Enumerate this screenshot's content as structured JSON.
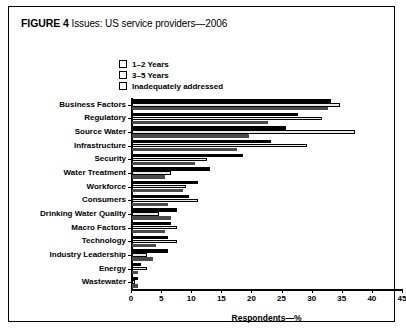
{
  "figure": {
    "label": "FIGURE 4",
    "caption": "Issues: US service providers—2006"
  },
  "legend": {
    "items": [
      {
        "label": "1–2 Years",
        "swatch": "solid-black"
      },
      {
        "label": "3–5 Years",
        "swatch": "light-gray"
      },
      {
        "label": "Inadequately addressed",
        "swatch": "dark-gray"
      }
    ]
  },
  "axis": {
    "x_title": "Respondents—%",
    "x_ticks": [
      "0",
      "5",
      "10",
      "15",
      "20",
      "25",
      "30",
      "35",
      "40",
      "45"
    ]
  },
  "chart_data": {
    "type": "bar",
    "orientation": "horizontal",
    "title": "Issues: US service providers—2006",
    "xlabel": "Respondents—%",
    "ylabel": "",
    "xlim": [
      0,
      45
    ],
    "xticks": [
      0,
      5,
      10,
      15,
      20,
      25,
      30,
      35,
      40,
      45
    ],
    "grid": false,
    "legend_position": "top-center",
    "categories": [
      "Business Factors",
      "Regulatory",
      "Source Water",
      "Infrastructure",
      "Security",
      "Water Treatment",
      "Workforce",
      "Consumers",
      "Drinking Water Quality",
      "Macro Factors",
      "Technology",
      "Industry Leadership",
      "Energy",
      "Wastewater"
    ],
    "series": [
      {
        "name": "1–2 Years",
        "color": "#000000",
        "values": [
          33,
          27.5,
          25.5,
          23,
          18.5,
          13,
          11,
          9.5,
          7.5,
          6.5,
          6,
          6,
          1.5,
          1
        ]
      },
      {
        "name": "3–5 Years",
        "color": "#e9e9e9",
        "values": [
          34.5,
          31.5,
          37,
          29,
          12.5,
          6.5,
          9,
          11,
          4.5,
          7.5,
          7.5,
          2.5,
          2.5,
          0.5
        ]
      },
      {
        "name": "Inadequately addressed",
        "color": "#4a4a4a",
        "values": [
          32.5,
          22.5,
          19.5,
          17.5,
          10.5,
          5.5,
          8.5,
          6,
          6.5,
          5.5,
          4,
          3.5,
          1,
          1
        ]
      }
    ]
  }
}
